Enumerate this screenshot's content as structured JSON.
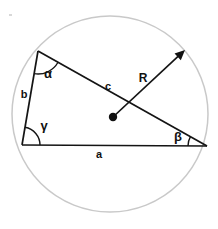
{
  "figure": {
    "background_color": "#ffffff",
    "width": 218,
    "height": 229
  },
  "circle": {
    "name": "circumscribed-circle",
    "center_x": 110,
    "center_y": 114,
    "radius": 98,
    "stroke_color": "#c9c9c9"
  },
  "center_point": {
    "label": "",
    "x": 113,
    "y": 117
  },
  "vertices": {
    "A": {
      "x": 38,
      "y": 51,
      "angle_label": "α"
    },
    "B": {
      "x": 22,
      "y": 145,
      "angle_label": "γ"
    },
    "C": {
      "x": 207,
      "y": 146,
      "angle_label": "β"
    }
  },
  "sides": [
    {
      "name": "side-a",
      "label": "a",
      "label_x": 99,
      "label_y": 158,
      "from": "B",
      "to": "C"
    },
    {
      "name": "side-b",
      "label": "b",
      "label_x": 24,
      "label_y": 98,
      "from": "A",
      "to": "B"
    },
    {
      "name": "side-c",
      "label": "c",
      "label_x": 108,
      "label_y": 90,
      "from": "A",
      "to": "C"
    }
  ],
  "angles": [
    {
      "name": "angle-alpha",
      "label": "α",
      "label_x": 48,
      "label_y": 78,
      "vertex": "A"
    },
    {
      "name": "angle-beta",
      "label": "β",
      "label_x": 178,
      "label_y": 141,
      "vertex": "C"
    },
    {
      "name": "angle-gamma",
      "label": "γ",
      "label_x": 44,
      "label_y": 130,
      "vertex": "B"
    }
  ],
  "radius_arrow": {
    "name": "radius-arrow",
    "label": "R",
    "label_x": 143,
    "label_y": 82,
    "start_x": 113,
    "start_y": 117,
    "end_x": 185,
    "end_y": 50,
    "color": "#111111"
  },
  "colors": {
    "line": "#141414",
    "circle": "#c9c9c9",
    "text": "#111111",
    "background": "#ffffff"
  }
}
